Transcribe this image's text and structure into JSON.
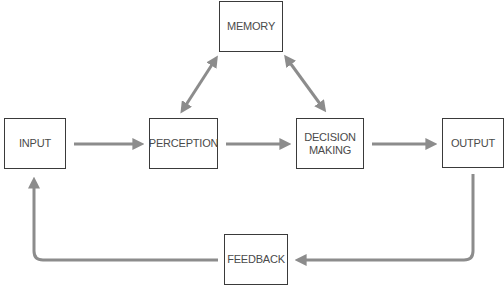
{
  "diagram": {
    "nodes": {
      "memory": "MEMORY",
      "input": "INPUT",
      "perception": "PERCEPTION",
      "decision_line1": "DECISION",
      "decision_line2": "MAKING",
      "output": "OUTPUT",
      "feedback": "FEEDBACK"
    },
    "edges": [
      {
        "from": "INPUT",
        "to": "PERCEPTION",
        "type": "one-way"
      },
      {
        "from": "PERCEPTION",
        "to": "DECISION MAKING",
        "type": "one-way"
      },
      {
        "from": "DECISION MAKING",
        "to": "OUTPUT",
        "type": "one-way"
      },
      {
        "from": "PERCEPTION",
        "to": "MEMORY",
        "type": "two-way"
      },
      {
        "from": "MEMORY",
        "to": "DECISION MAKING",
        "type": "two-way"
      },
      {
        "from": "OUTPUT",
        "to": "FEEDBACK",
        "type": "one-way"
      },
      {
        "from": "FEEDBACK",
        "to": "INPUT",
        "type": "one-way"
      }
    ],
    "colors": {
      "arrow": "#8c8c8c",
      "box_border": "#3a3a3a",
      "text": "#4a4a4a"
    }
  }
}
